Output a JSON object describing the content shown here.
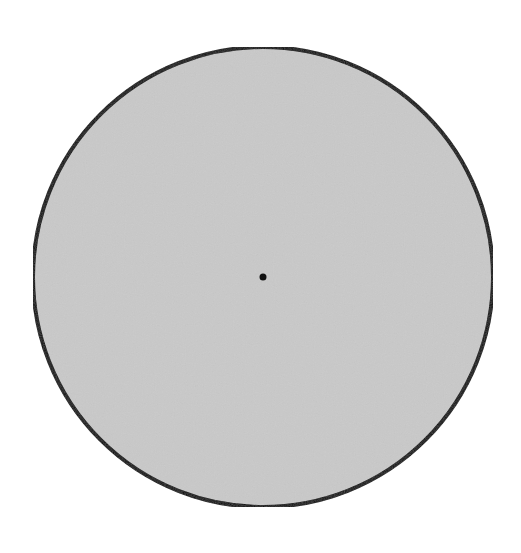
{
  "diagram": {
    "type": "circle",
    "circle": {
      "cx": 263,
      "cy": 277,
      "r": 230,
      "fill": "#c9c9c9",
      "stroke": "#111111",
      "stroke_width": 4
    },
    "center_point": {
      "cx": 263,
      "cy": 277,
      "r": 3.5,
      "fill": "#111111"
    }
  }
}
